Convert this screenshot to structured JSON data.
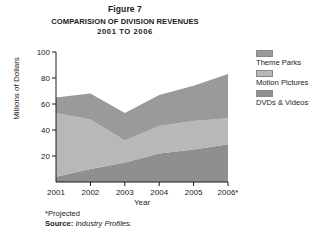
{
  "figure": {
    "label": "Figure 7",
    "title_line1": "COMPARISION OF DIVISION REVENUES",
    "title_line2": "2001  TO 2006"
  },
  "footnote": {
    "projected": "*Projected",
    "source_label": "Source:",
    "source_value": "Industry Profiles."
  },
  "legend": {
    "items": [
      {
        "label": "Theme Parks",
        "color": "#9a9a9a"
      },
      {
        "label": "Motion Pictures",
        "color": "#b8b8b8"
      },
      {
        "label": "DVDs & Videos",
        "color": "#8f8f8f"
      }
    ]
  },
  "chart_data": {
    "type": "area",
    "stacked": true,
    "title": "COMPARISION OF DIVISION REVENUES 2001 TO 2006",
    "xlabel": "Year",
    "ylabel": "Millions of Dollars",
    "categories": [
      "2001",
      "2002",
      "2003",
      "2004",
      "2005",
      "2006*"
    ],
    "x_tick_labels": [
      "2001",
      "2002",
      "2003",
      "2004",
      "2005",
      "2006*"
    ],
    "y_tick_labels": [
      "20",
      "40",
      "60",
      "80",
      "100"
    ],
    "y_ticks": [
      20,
      40,
      60,
      80,
      100
    ],
    "ylim": [
      0,
      100
    ],
    "grid": false,
    "legend_position": "right",
    "series": [
      {
        "name": "DVDs & Videos",
        "color": "#8f8f8f",
        "values": [
          4,
          10,
          15,
          22,
          25,
          29
        ]
      },
      {
        "name": "Motion Pictures",
        "color": "#b8b8b8",
        "values": [
          49,
          38,
          17,
          21,
          22,
          20
        ]
      },
      {
        "name": "Theme Parks",
        "color": "#9a9a9a",
        "values": [
          12,
          20,
          21,
          24,
          27,
          34
        ]
      }
    ],
    "cumulative_tops": {
      "DVDs & Videos": [
        4,
        10,
        15,
        22,
        25,
        29
      ],
      "Motion Pictures": [
        53,
        48,
        32,
        43,
        47,
        49
      ],
      "Theme Parks": [
        65,
        68,
        53,
        67,
        74,
        83
      ]
    }
  }
}
